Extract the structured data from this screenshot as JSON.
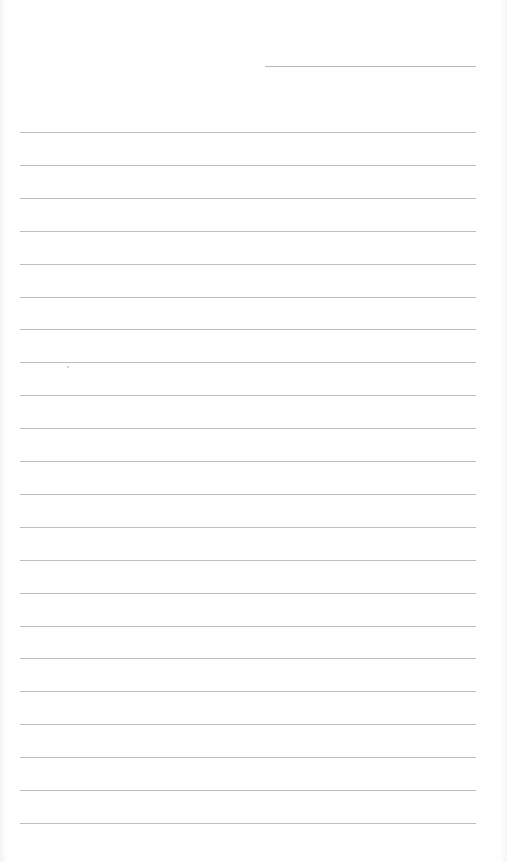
{
  "page": {
    "type": "lined-paper",
    "date_line": {
      "label": ""
    },
    "rule_count": 22,
    "rule_color": "#bdbdbd",
    "lines": [
      "",
      "",
      "",
      "",
      "",
      "",
      "",
      "",
      "",
      "",
      "",
      "",
      "",
      "",
      "",
      "",
      "",
      "",
      "",
      "",
      "",
      ""
    ]
  }
}
